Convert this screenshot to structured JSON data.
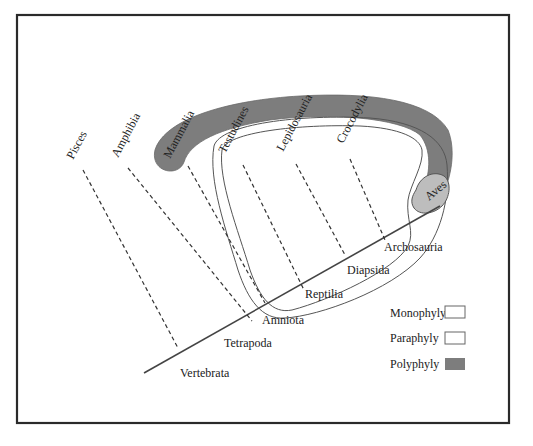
{
  "figure": {
    "taxa_tips": [
      {
        "label": "Pisces",
        "x": 73,
        "y": 160,
        "rot": -62,
        "line": [
          [
            83,
            170
          ],
          [
            178,
            348
          ]
        ]
      },
      {
        "label": "Amphibia",
        "x": 118,
        "y": 158,
        "rot": -62,
        "line": [
          [
            128,
            168
          ],
          [
            252,
            321
          ]
        ]
      },
      {
        "label": "Mammalia",
        "x": 170,
        "y": 159,
        "rot": -62,
        "line": [
          [
            188,
            166
          ],
          [
            265,
            303
          ]
        ]
      },
      {
        "label": "Testudines",
        "x": 225,
        "y": 154,
        "rot": -62,
        "line": [
          [
            243,
            165
          ],
          [
            304,
            290
          ]
        ]
      },
      {
        "label": "Lepidosauria",
        "x": 283,
        "y": 152,
        "rot": -62,
        "line": [
          [
            296,
            164
          ],
          [
            345,
            255
          ]
        ]
      },
      {
        "label": "Crocodylia",
        "x": 343,
        "y": 144,
        "rot": -62,
        "line": [
          [
            350,
            159
          ],
          [
            385,
            240
          ]
        ]
      },
      {
        "label": "Aves",
        "x": 429,
        "y": 201,
        "rot": -40
      }
    ],
    "clade_nodes": [
      {
        "label": "Vertebrata",
        "x": 180,
        "y": 377
      },
      {
        "label": "Tetrapoda",
        "x": 224,
        "y": 347
      },
      {
        "label": "Amniota",
        "x": 262,
        "y": 324
      },
      {
        "label": "Reptilia",
        "x": 305,
        "y": 298
      },
      {
        "label": "Diapsida",
        "x": 347,
        "y": 274
      },
      {
        "label": "Archosauria",
        "x": 384,
        "y": 251
      }
    ],
    "axis_line": [
      [
        144,
        373
      ],
      [
        440,
        206
      ]
    ],
    "legend": [
      {
        "label": "Monophyly",
        "type": "monophyly",
        "color": "#ffffff"
      },
      {
        "label": "Paraphyly",
        "type": "paraphyly",
        "color": "#ffffff"
      },
      {
        "label": "Polyphyly",
        "type": "polyphyly",
        "color": "#7d7d7d"
      }
    ],
    "colors": {
      "polyphyly_fill": "#7d7d7d",
      "aves_fill": "#bdbdbd",
      "frame_stroke": "#2a2a2a"
    }
  }
}
